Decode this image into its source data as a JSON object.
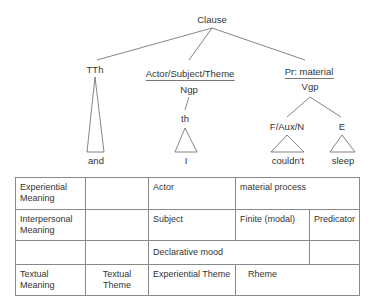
{
  "tree": {
    "root": "Clause",
    "nodes": {
      "tth": "TTh",
      "actor": "Actor/Subject/Theme",
      "ngp": "Ngp",
      "th": "th",
      "pr": "Pr: material",
      "vgp": "Vgp",
      "faux": "F/Aux/N",
      "e": "E"
    },
    "leaves": {
      "and": "and",
      "i": "I",
      "couldnt": "couldn't",
      "sleep": "sleep"
    }
  },
  "table": {
    "rows": [
      {
        "label": "Experiential Meaning",
        "cells": [
          "",
          "Actor",
          "material process"
        ]
      },
      {
        "label": "Interpersonal Meaning",
        "cells": [
          "",
          "Subject",
          "Finite (modal)",
          "Predicator"
        ]
      },
      {
        "label": "",
        "cells": [
          "",
          "Declarative mood",
          ""
        ]
      },
      {
        "label": "Textual Meaning",
        "cells": [
          "Textual Theme",
          "Experiential Theme",
          "Rheme"
        ]
      }
    ]
  }
}
